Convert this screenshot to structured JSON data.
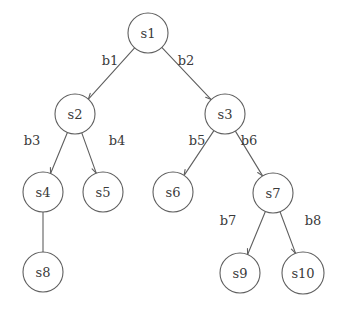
{
  "diagram": {
    "type": "tree-graph",
    "title": "",
    "background_color": "#ffffff",
    "stroke_color": "#5f5f5f",
    "text_color": "#3a3a3a",
    "node_fill": "#ffffff"
  },
  "chart_data": {
    "type": "tree",
    "title": "",
    "nodes": [
      {
        "id": "s1",
        "label": "s1",
        "cx": 148,
        "cy": 33,
        "r": 20,
        "depth": 0
      },
      {
        "id": "s2",
        "label": "s2",
        "cx": 75,
        "cy": 114,
        "r": 20,
        "depth": 1
      },
      {
        "id": "s3",
        "label": "s3",
        "cx": 225,
        "cy": 114,
        "r": 20,
        "depth": 1
      },
      {
        "id": "s4",
        "label": "s4",
        "cx": 43,
        "cy": 192,
        "r": 20,
        "depth": 2
      },
      {
        "id": "s5",
        "label": "s5",
        "cx": 103,
        "cy": 192,
        "r": 20,
        "depth": 2
      },
      {
        "id": "s6",
        "label": "s6",
        "cx": 173,
        "cy": 192,
        "r": 20,
        "depth": 2
      },
      {
        "id": "s7",
        "label": "s7",
        "cx": 273,
        "cy": 193,
        "r": 20,
        "depth": 2
      },
      {
        "id": "s8",
        "label": "s8",
        "cx": 43,
        "cy": 272,
        "r": 20,
        "depth": 3
      },
      {
        "id": "s9",
        "label": "s9",
        "cx": 240,
        "cy": 273,
        "r": 20,
        "depth": 3
      },
      {
        "id": "s10",
        "label": "s10",
        "cx": 303,
        "cy": 273,
        "r": 21,
        "depth": 3
      }
    ],
    "edges": [
      {
        "id": "b1",
        "label": "b1",
        "from": "s1",
        "to": "s2",
        "label_x": 110,
        "label_y": 60
      },
      {
        "id": "b2",
        "label": "b2",
        "from": "s1",
        "to": "s3",
        "label_x": 186,
        "label_y": 60
      },
      {
        "id": "b3",
        "label": "b3",
        "from": "s2",
        "to": "s4",
        "label_x": 32,
        "label_y": 140
      },
      {
        "id": "b4",
        "label": "b4",
        "from": "s2",
        "to": "s5",
        "label_x": 117,
        "label_y": 140
      },
      {
        "id": "b5",
        "label": "b5",
        "from": "s3",
        "to": "s6",
        "label_x": 197,
        "label_y": 140
      },
      {
        "id": "b6",
        "label": "b6",
        "from": "s3",
        "to": "s7",
        "label_x": 249,
        "label_y": 140
      },
      {
        "id": "b7",
        "label": "b7",
        "from": "s7",
        "to": "s9",
        "label_x": 228,
        "label_y": 220
      },
      {
        "id": "b8",
        "label": "b8",
        "from": "s7",
        "to": "s10",
        "label_x": 313,
        "label_y": 220
      },
      {
        "id": "e-s4-s8",
        "label": "",
        "from": "s4",
        "to": "s8",
        "label_x": 0,
        "label_y": 0
      }
    ],
    "node_count": 10,
    "edge_count": 9,
    "labeled_edge_count": 8,
    "root": "s1",
    "leaves": [
      "s5",
      "s6",
      "s8",
      "s9",
      "s10"
    ],
    "max_depth": 3
  }
}
